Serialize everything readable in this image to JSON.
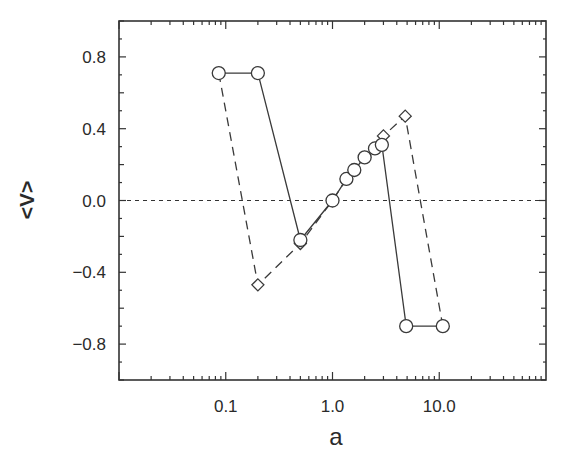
{
  "chart_data": {
    "type": "line",
    "title": "",
    "xlabel": "a",
    "ylabel": "<V>",
    "xscale": "log",
    "xlim": [
      0.01,
      100
    ],
    "ylim": [
      -1.0,
      1.0
    ],
    "x_tick_labels": [
      "0.1",
      "1.0",
      "10.0"
    ],
    "x_tick_values": [
      0.1,
      1.0,
      10.0
    ],
    "y_tick_labels": [
      "0.8",
      "0.4",
      "0.0",
      "−0.4",
      "−0.8"
    ],
    "y_tick_values": [
      0.8,
      0.4,
      0.0,
      -0.4,
      -0.8
    ],
    "grid": false,
    "legend": null,
    "reference_line": {
      "y": 0.0,
      "style": "dotted"
    },
    "series": [
      {
        "name": "circles (solid line)",
        "marker": "circle",
        "line_style": "solid",
        "x": [
          0.086,
          0.2,
          0.5,
          1.0,
          1.35,
          1.6,
          2.0,
          2.5,
          2.9,
          4.9,
          10.8
        ],
        "y": [
          0.71,
          0.71,
          -0.22,
          0.0,
          0.12,
          0.17,
          0.24,
          0.29,
          0.31,
          -0.7,
          -0.7
        ]
      },
      {
        "name": "diamonds (dashed line)",
        "marker": "diamond",
        "line_style": "dashed",
        "x": [
          0.086,
          0.2,
          0.5,
          1.0,
          1.35,
          1.6,
          2.0,
          2.5,
          3.0,
          4.8,
          10.8
        ],
        "y": [
          0.71,
          -0.47,
          -0.24,
          0.0,
          0.12,
          0.17,
          0.24,
          0.29,
          0.36,
          0.47,
          -0.7
        ]
      }
    ]
  },
  "colors": {
    "axis": "#333333",
    "line": "#3a3a3a",
    "marker_fill": "#ffffff"
  }
}
